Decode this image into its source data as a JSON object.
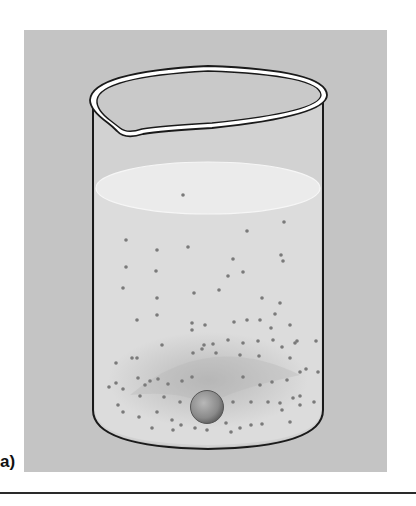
{
  "figure": {
    "panel_label": "a)",
    "colors": {
      "background_panel": "#c4c4c4",
      "liquid": "#dcdcdc",
      "liquid_surface": "#ebebeb",
      "outline": "#1a1a1a",
      "particle": "#7a7a7a",
      "sphere": "#8a8a8a"
    },
    "particles": [
      [
        183,
        195
      ],
      [
        126,
        240
      ],
      [
        157,
        250
      ],
      [
        188,
        247
      ],
      [
        247,
        231
      ],
      [
        284,
        222
      ],
      [
        281,
        255
      ],
      [
        283,
        261
      ],
      [
        126,
        267
      ],
      [
        156,
        271
      ],
      [
        233,
        259
      ],
      [
        123,
        288
      ],
      [
        157,
        298
      ],
      [
        194,
        293
      ],
      [
        219,
        290
      ],
      [
        262,
        298
      ],
      [
        280,
        303
      ],
      [
        137,
        320
      ],
      [
        157,
        315
      ],
      [
        192,
        323
      ],
      [
        205,
        325
      ],
      [
        234,
        322
      ],
      [
        247,
        320
      ],
      [
        260,
        320
      ],
      [
        275,
        314
      ],
      [
        243,
        272
      ],
      [
        228,
        276
      ],
      [
        192,
        330
      ],
      [
        271,
        328
      ],
      [
        290,
        325
      ],
      [
        132,
        358
      ],
      [
        162,
        345
      ],
      [
        204,
        345
      ],
      [
        213,
        344
      ],
      [
        243,
        343
      ],
      [
        258,
        341
      ],
      [
        273,
        340
      ],
      [
        295,
        343
      ],
      [
        316,
        341
      ],
      [
        116,
        363
      ],
      [
        137,
        358
      ],
      [
        193,
        353
      ],
      [
        202,
        349
      ],
      [
        216,
        353
      ],
      [
        228,
        340
      ],
      [
        240,
        355
      ],
      [
        259,
        356
      ],
      [
        282,
        347
      ],
      [
        297,
        341
      ],
      [
        290,
        358
      ],
      [
        306,
        369
      ],
      [
        116,
        383
      ],
      [
        123,
        389
      ],
      [
        145,
        385
      ],
      [
        158,
        379
      ],
      [
        168,
        384
      ],
      [
        182,
        381
      ],
      [
        192,
        377
      ],
      [
        243,
        377
      ],
      [
        260,
        385
      ],
      [
        272,
        382
      ],
      [
        287,
        380
      ],
      [
        300,
        372
      ],
      [
        318,
        372
      ],
      [
        109,
        387
      ],
      [
        138,
        378
      ],
      [
        150,
        381
      ],
      [
        140,
        396
      ],
      [
        164,
        397
      ],
      [
        180,
        402
      ],
      [
        233,
        402
      ],
      [
        251,
        402
      ],
      [
        268,
        402
      ],
      [
        280,
        403
      ],
      [
        293,
        398
      ],
      [
        300,
        396
      ],
      [
        314,
        402
      ],
      [
        123,
        412
      ],
      [
        139,
        417
      ],
      [
        157,
        412
      ],
      [
        172,
        420
      ],
      [
        181,
        425
      ],
      [
        226,
        423
      ],
      [
        240,
        428
      ],
      [
        251,
        425
      ],
      [
        290,
        422
      ],
      [
        300,
        405
      ],
      [
        118,
        405
      ],
      [
        282,
        410
      ],
      [
        207,
        430
      ],
      [
        195,
        428
      ],
      [
        173,
        430
      ],
      [
        231,
        432
      ],
      [
        152,
        428
      ],
      [
        262,
        424
      ]
    ]
  }
}
